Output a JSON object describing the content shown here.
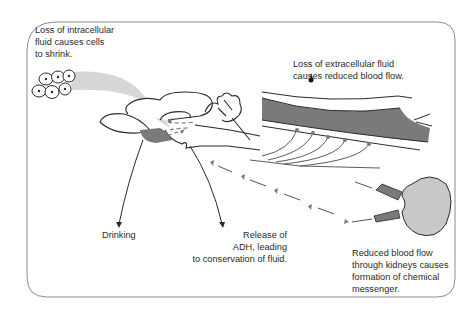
{
  "diagram": {
    "colors": {
      "frame": "#8a8a8a",
      "dark_fill": "#7a7a7a",
      "light_band": "#d6d6d6",
      "kidney_fill": "#c8c8c8",
      "ink": "#2a2a2a"
    },
    "labels": {
      "intracellular": "Loss of intracellular\nfluid causes cells\nto shrink.",
      "extracellular": "Loss of extracellular fluid\ncauses reduced blood flow.",
      "drinking": "Drinking",
      "adh": "Release of\nADH, leading\nto conservation of fluid.",
      "kidney": "Reduced blood flow\nthrough kidneys causes\nformation of chemical\nmessenger."
    },
    "elements": {
      "cells": "cell-cluster-icon",
      "brain": "brain-icon",
      "vessel": "blood-vessel-icon",
      "kidney": "kidney-icon",
      "messenger_path": "dashed-arrow-path"
    }
  }
}
